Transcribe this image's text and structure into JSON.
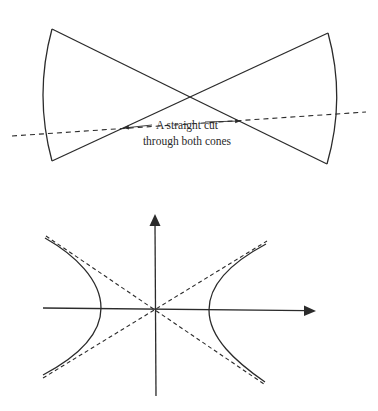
{
  "figure": {
    "top_panel": {
      "description": "Double cone cut by a straight plane",
      "label_line1": "A straight cut",
      "label_line2": "through both cones",
      "apex": [
        190,
        97
      ],
      "left_cone": {
        "top": [
          52,
          29
        ],
        "bottom": [
          52,
          161
        ],
        "arc_bulge_x": 43
      },
      "right_cone": {
        "top": [
          328,
          33
        ],
        "bottom": [
          327,
          164
        ],
        "arc_bulge_x": 337
      },
      "cut_line": {
        "start": [
          12,
          136
        ],
        "end": [
          366,
          112
        ],
        "style": "dashed"
      },
      "arrows": [
        {
          "from": [
            152,
            125
          ],
          "to": [
            123,
            128
          ]
        },
        {
          "from": [
            205,
            122
          ],
          "to": [
            240,
            121
          ]
        }
      ]
    },
    "bottom_panel": {
      "description": "Hyperbola with asymptotes on coordinate axes",
      "origin": [
        155,
        310
      ],
      "x_axis": {
        "start": [
          43,
          308
        ],
        "end": [
          315,
          311
        ]
      },
      "y_axis": {
        "start": [
          156,
          396
        ],
        "end": [
          155,
          215
        ]
      },
      "left_branch": {
        "top": [
          45,
          238
        ],
        "vertex": [
          101,
          308
        ],
        "bottom": [
          43,
          375
        ]
      },
      "right_branch": {
        "top": [
          266,
          244
        ],
        "vertex": [
          209,
          310
        ],
        "bottom": [
          265,
          382
        ]
      },
      "asymptotes": [
        {
          "start": [
            46,
            236
          ],
          "end": [
            264,
            384
          ],
          "style": "dashed"
        },
        {
          "start": [
            43,
            378
          ],
          "end": [
            267,
            241
          ],
          "style": "dashed"
        }
      ]
    },
    "colors": {
      "line": "#2b2b2b",
      "background": "#ffffff"
    }
  }
}
